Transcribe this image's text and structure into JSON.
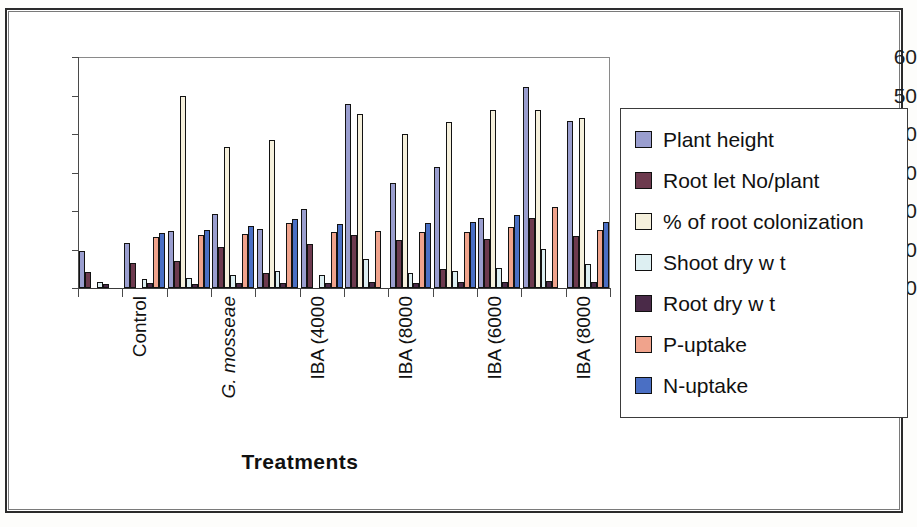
{
  "chart_data": {
    "type": "bar",
    "title": "",
    "xlabel": "Treatments",
    "ylabel": "",
    "ylim": [
      0,
      60
    ],
    "yticks": [
      0,
      10,
      20,
      30,
      40,
      50,
      60
    ],
    "grid": false,
    "legend_position": "right",
    "categories": [
      "Control",
      "Control",
      "G. mosseae",
      "G. mosseae",
      "IBA (4000",
      "IBA (4000",
      "IBA (8000",
      "IBA (8000",
      "IBA (6000",
      "IBA (6000",
      "IBA (8000",
      "IBA (8000"
    ],
    "category_labels_shown": [
      "Control",
      "G. mosseae",
      "IBA (4000",
      "IBA (8000",
      "IBA (6000",
      "IBA (8000"
    ],
    "series": [
      {
        "name": "Plant height",
        "color": "#9a9ecf",
        "values": [
          9.5,
          11.8,
          14.7,
          19.3,
          15.2,
          20.5,
          47.7,
          27.3,
          31.5,
          18.2,
          52.3,
          43.3
        ]
      },
      {
        "name": "Root let No/plant",
        "color": "#6d3a4e",
        "values": [
          4.2,
          6.4,
          7.1,
          10.6,
          4.0,
          11.5,
          13.7,
          12.4,
          5.0,
          12.8,
          18.2,
          13.4
        ]
      },
      {
        "name": "% of root colonization",
        "color": "#f5f0dc",
        "values": [
          0.0,
          0.0,
          50.0,
          36.5,
          38.5,
          0.0,
          45.3,
          40.0,
          43.0,
          46.3,
          46.3,
          44.2
        ]
      },
      {
        "name": "Shoot dry wt",
        "color": "#ddeff2",
        "values": [
          1.6,
          2.3,
          2.6,
          3.5,
          4.5,
          3.4,
          7.5,
          4.0,
          4.4,
          5.2,
          10.2,
          6.3
        ]
      },
      {
        "name": "Root dry wt",
        "color": "#4a2a48",
        "values": [
          1.0,
          1.2,
          1.1,
          1.3,
          1.3,
          1.4,
          1.5,
          1.4,
          1.5,
          1.6,
          1.7,
          1.6
        ]
      },
      {
        "name": "P-uptake",
        "color": "#f0a38c",
        "values": [
          0.0,
          13.2,
          13.9,
          14.0,
          17.0,
          14.6,
          14.7,
          14.5,
          14.6,
          15.9,
          21.0,
          15.0
        ]
      },
      {
        "name": "N-uptake",
        "color": "#4a6fc4",
        "values": [
          0.0,
          14.4,
          15.0,
          16.2,
          18.0,
          16.5,
          0.0,
          17.0,
          17.2,
          19.0,
          0.0,
          17.2
        ]
      }
    ]
  },
  "legend": {
    "items": [
      {
        "label": "Plant height",
        "swatch": "legend-swatch-plant-height"
      },
      {
        "label": "Root let No/plant",
        "swatch": "legend-swatch-rootlet-no-per-plant"
      },
      {
        "label": "% of root colonization",
        "swatch": "legend-swatch-root-colonization"
      },
      {
        "label": "Shoot dry w t",
        "swatch": "legend-swatch-shoot-dry-wt"
      },
      {
        "label": "Root dry w t",
        "swatch": "legend-swatch-root-dry-wt"
      },
      {
        "label": "P-uptake",
        "swatch": "legend-swatch-p-uptake"
      },
      {
        "label": "N-uptake",
        "swatch": "legend-swatch-n-uptake"
      }
    ]
  },
  "axes": {
    "x_title": "Treatments",
    "y_ticks": [
      "0",
      "10",
      "20",
      "30",
      "40",
      "50",
      "60"
    ],
    "x_group_labels": [
      {
        "text": "Control",
        "italic": false
      },
      {
        "text": "G. mosseae",
        "italic": true
      },
      {
        "text": "IBA (4000",
        "italic": false
      },
      {
        "text": "IBA (8000",
        "italic": false
      },
      {
        "text": "IBA (6000",
        "italic": false
      },
      {
        "text": "IBA (8000",
        "italic": false
      }
    ]
  }
}
